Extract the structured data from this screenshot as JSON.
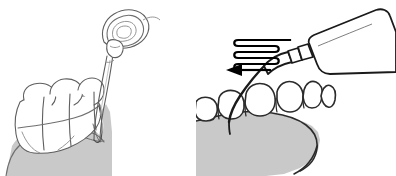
{
  "figure": {
    "title": "Ultrasonic scaler tip insertion and sweeping motion diagram",
    "width": 396,
    "height": 176,
    "background_color": "#ffffff"
  },
  "colors": {
    "outline": "#2b2b2b",
    "outline_light": "#6f6f6f",
    "tooth_fill": "#ffffff",
    "gingiva_fill": "#c9c9c9",
    "gingiva_fill_light": "#cfcfcf",
    "instrument_fill": "#ffffff",
    "arrow_fill": "#000000",
    "tip_stroke": "#1a1a1a"
  },
  "panels": [
    {
      "id": "left-panel",
      "name": "subgingival-insertion-view",
      "caption": "",
      "elements": {
        "handpiece_head_label": "handpiece head",
        "shaft_label": "instrument shaft",
        "tip_label": "scaler tip",
        "teeth_label": "molar teeth",
        "gingiva_label": "gingiva",
        "sulcus_label": "gingival sulcus"
      }
    },
    {
      "id": "right-panel",
      "name": "sweeping-motion-view",
      "caption": "",
      "elements": {
        "motion_indicator_label": "serpentine sweep motion",
        "arrow_label": "direction of movement",
        "handpiece_body_label": "ultrasonic handpiece",
        "collar_label": "handpiece collar",
        "tip_label": "scaler tip",
        "teeth_label": "anterior teeth",
        "gingiva_label": "gingiva"
      }
    }
  ],
  "motion": {
    "stroke_count": 4,
    "arrow_direction": "left"
  }
}
